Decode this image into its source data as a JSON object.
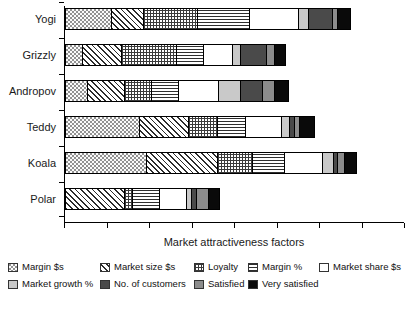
{
  "chart_data": {
    "type": "bar",
    "orientation": "horizontal",
    "stacked": true,
    "title": "",
    "xlabel": "Market attractiveness factors",
    "ylabel": "",
    "grid": false,
    "legend_position": "bottom",
    "axis_tick_labels_shown": false,
    "xlim": [
      0,
      100
    ],
    "x_tick_count": 9,
    "categories": [
      "Yogi",
      "Grizzly",
      "Andropov",
      "Teddy",
      "Koala",
      "Polar"
    ],
    "series": [
      {
        "name": "Margin $s",
        "pattern": "light-dotted",
        "values": [
          13.5,
          5.0,
          6.5,
          22.0,
          24.0,
          0.0
        ]
      },
      {
        "name": "Market size $s",
        "pattern": "diagonal-hatch",
        "values": [
          9.5,
          11.5,
          11.0,
          14.5,
          21.0,
          17.5
        ]
      },
      {
        "name": "Loyalty",
        "pattern": "crosshatch-grid",
        "values": [
          16.0,
          16.5,
          8.0,
          8.5,
          10.5,
          2.5
        ]
      },
      {
        "name": "Margin %",
        "pattern": "horizontal-lines",
        "values": [
          15.5,
          8.0,
          8.0,
          8.5,
          9.5,
          8.0
        ]
      },
      {
        "name": "Market share $s",
        "pattern": "white-empty",
        "values": [
          14.5,
          8.5,
          12.0,
          10.5,
          11.0,
          8.0
        ]
      },
      {
        "name": "Market growth %",
        "pattern": "light-gray",
        "values": [
          3.0,
          2.5,
          6.5,
          2.5,
          3.5,
          1.5
        ]
      },
      {
        "name": "No. of customers",
        "pattern": "dark-gray",
        "values": [
          7.0,
          7.5,
          6.5,
          1.5,
          1.0,
          1.5
        ]
      },
      {
        "name": "Satisfied",
        "pattern": "medium-gray",
        "values": [
          1.5,
          2.5,
          3.5,
          1.5,
          2.0,
          3.5
        ]
      },
      {
        "name": "Very satisfied",
        "pattern": "black",
        "values": [
          3.5,
          3.0,
          4.0,
          4.0,
          3.5,
          3.0
        ]
      }
    ],
    "totals": [
      84.0,
      65.0,
      66.0,
      73.5,
      86.0,
      45.5
    ]
  },
  "axis": {
    "x_title": "Market attractiveness factors"
  },
  "legend": {
    "items": [
      {
        "label": "Margin $s",
        "pattern_class": "p-margin-dollars"
      },
      {
        "label": "Market size $s",
        "pattern_class": "p-market-size"
      },
      {
        "label": "Loyalty",
        "pattern_class": "p-loyalty"
      },
      {
        "label": "Margin %",
        "pattern_class": "p-margin-pct"
      },
      {
        "label": "Market share $s",
        "pattern_class": "p-market-share"
      },
      {
        "label": "Market growth %",
        "pattern_class": "p-market-growth"
      },
      {
        "label": "No. of customers",
        "pattern_class": "p-customers"
      },
      {
        "label": "Satisfied",
        "pattern_class": "p-satisfied"
      },
      {
        "label": "Very satisfied",
        "pattern_class": "p-very-satisfied"
      }
    ]
  },
  "colors": {
    "axis": "#000000",
    "text": "#1a1a1a",
    "background": "#ffffff"
  }
}
